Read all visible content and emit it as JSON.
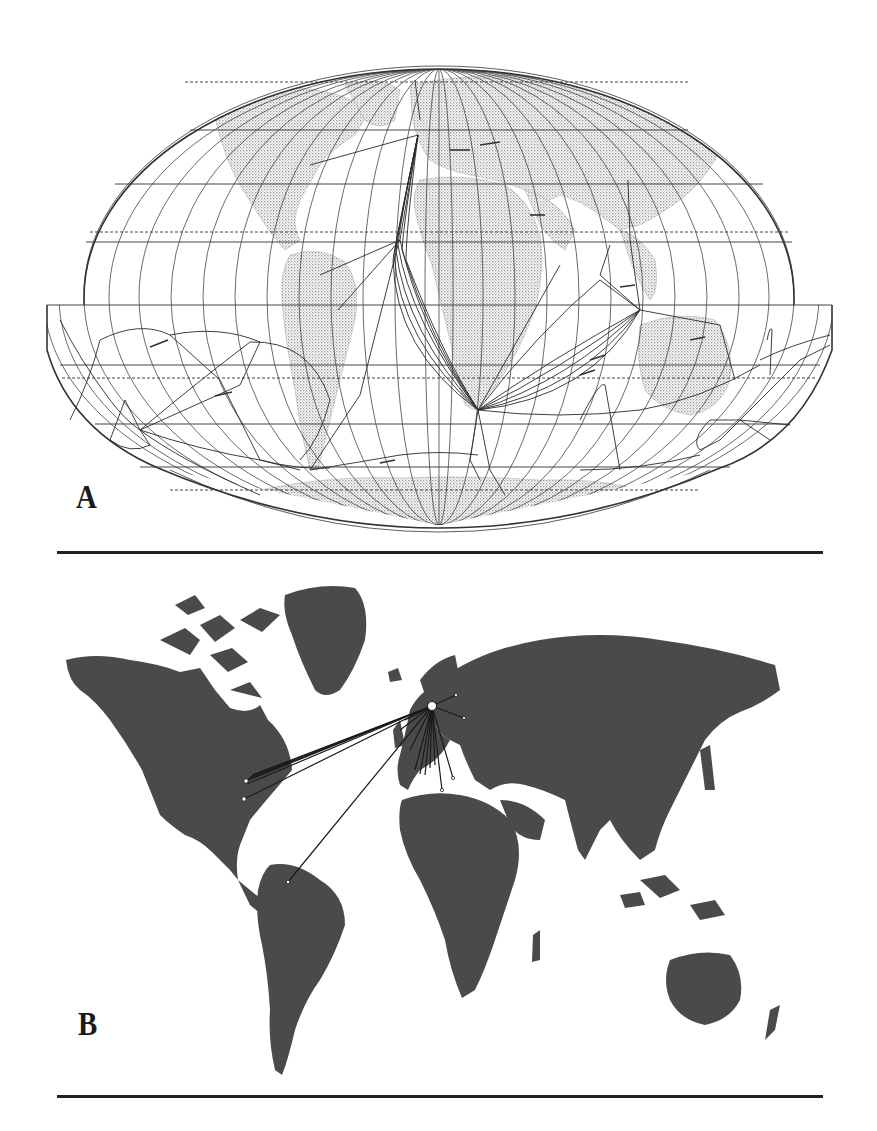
{
  "figure": {
    "panels": [
      {
        "id": "A",
        "label": "A",
        "description": "World map in pseudo-cylindrical (Mollweide-type) projection with graticule; grey-stippled landmasses; many drawn route lines converging on southern Africa, Indian Ocean and Southeast Asia; southern band interrupted/extended beyond the ellipse",
        "colors": {
          "land": "#b8b8b8",
          "lines": "#333333",
          "background": "#ffffff"
        },
        "route_hubs": [
          "cape-of-good-hope",
          "western-europe",
          "java-region",
          "new-zealand-region",
          "south-america-tip"
        ]
      },
      {
        "id": "B",
        "label": "B",
        "description": "World map with dark grey landmasses; radial lines from a single hub in northern Europe to eastern North America, northern South America, and many points across Europe",
        "colors": {
          "land": "#4a4a4a",
          "lines": "#1a1a1a",
          "hub": "#ffffff",
          "background": "#ffffff"
        },
        "hub_location": "northern-europe",
        "destinations": [
          "eastern-north-america",
          "northern-south-america",
          "western-europe",
          "central-europe",
          "southern-europe",
          "eastern-europe"
        ]
      }
    ]
  }
}
